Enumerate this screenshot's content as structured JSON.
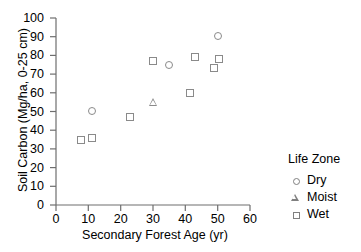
{
  "chart_data": {
    "type": "scatter",
    "title": "",
    "xlabel": "Secondary Forest Age (yr)",
    "ylabel": "Soil Carbon (Mg/ha, 0-25 cm)",
    "xlim": [
      0,
      60
    ],
    "ylim": [
      0,
      100
    ],
    "xticks": [
      0,
      10,
      20,
      30,
      40,
      50,
      60
    ],
    "yticks": [
      0,
      10,
      20,
      30,
      40,
      50,
      60,
      70,
      80,
      90,
      100
    ],
    "grid": false,
    "legend_position": "right",
    "legend_title": "Life Zone",
    "series": [
      {
        "name": "Dry",
        "marker": "circle",
        "color": "#8a8a8a",
        "points": [
          {
            "x": 11,
            "y": 50.5
          },
          {
            "x": 35,
            "y": 75
          },
          {
            "x": 50,
            "y": 90.5
          }
        ]
      },
      {
        "name": "Moist",
        "marker": "triangle",
        "color": "#8a8a8a",
        "points": [
          {
            "x": 30,
            "y": 55
          }
        ]
      },
      {
        "name": "Wet",
        "marker": "square",
        "color": "#8a8a8a",
        "points": [
          {
            "x": 7.7,
            "y": 35
          },
          {
            "x": 11,
            "y": 36
          },
          {
            "x": 23,
            "y": 47
          },
          {
            "x": 30,
            "y": 77
          },
          {
            "x": 41.5,
            "y": 60
          },
          {
            "x": 43,
            "y": 79
          },
          {
            "x": 49,
            "y": 73
          },
          {
            "x": 50.5,
            "y": 78
          }
        ]
      }
    ]
  },
  "axis": {
    "ytick_labels": [
      "100",
      "90",
      "80",
      "70",
      "60",
      "50",
      "40",
      "30",
      "20",
      "10",
      "0"
    ],
    "xtick_labels": [
      "0",
      "10",
      "20",
      "30",
      "40",
      "50",
      "60"
    ]
  },
  "legend": {
    "title": "Life Zone",
    "entries": [
      {
        "label": "Dry",
        "marker": "circle-icon"
      },
      {
        "label": "Moist",
        "marker": "triangle-icon"
      },
      {
        "label": "Wet",
        "marker": "square-icon"
      }
    ]
  }
}
